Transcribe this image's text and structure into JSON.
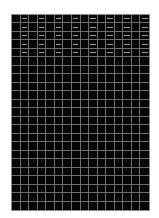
{
  "sheet": {
    "columns": 16,
    "rows": 23,
    "colors": {
      "background": "#050505",
      "gridline": "#6e6e6e",
      "border": "#8a8a8a",
      "text": "#9a9a9a"
    },
    "filled_rows": 5,
    "filled_column_indices": [
      1,
      3,
      5,
      7,
      9,
      11,
      13,
      15
    ],
    "cell_values": [
      [
        "",
        "—",
        "",
        "—",
        "",
        "—",
        "",
        "—",
        "",
        "—",
        "",
        "—",
        "",
        "—",
        "",
        "—"
      ],
      [
        "",
        "—",
        "",
        "—",
        "",
        "—",
        "",
        "—",
        "",
        "—",
        "",
        "—",
        "",
        "—",
        "",
        "—"
      ],
      [
        "",
        "—",
        "",
        "—",
        "",
        "—",
        "",
        "—",
        "",
        "—",
        "",
        "—",
        "",
        "—",
        "",
        "—"
      ],
      [
        "",
        "—",
        "",
        "—",
        "",
        "—",
        "",
        "—",
        "",
        "—",
        "",
        "—",
        "",
        "—",
        "",
        "—"
      ],
      [
        "",
        "—",
        "",
        "—",
        "",
        "—",
        "",
        "—",
        "",
        "—",
        "",
        "—",
        "",
        "—",
        "",
        "—"
      ]
    ]
  }
}
